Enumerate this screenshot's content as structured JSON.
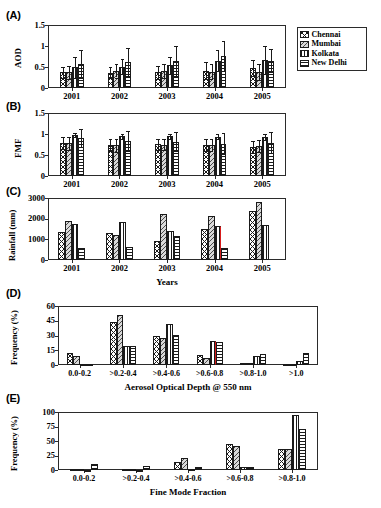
{
  "figure": {
    "legend": {
      "items": [
        {
          "label": "Chennai",
          "pattern": "crosshatch"
        },
        {
          "label": "Mumbai",
          "pattern": "diagonal"
        },
        {
          "label": "Kolkata",
          "pattern": "vertical"
        },
        {
          "label": "New Delhi",
          "pattern": "horizontal"
        }
      ]
    },
    "panels": [
      {
        "tag": "(A)"
      },
      {
        "tag": "(B)"
      },
      {
        "tag": "(C)"
      },
      {
        "tag": "(D)"
      },
      {
        "tag": "(E)"
      }
    ]
  },
  "chart_data": [
    {
      "panel": "A",
      "type": "bar",
      "title": "",
      "xlabel": "",
      "ylabel": "AOD",
      "categories": [
        "2001",
        "2002",
        "2003",
        "2004",
        "2005"
      ],
      "yticks": [
        "0",
        "0.5",
        "1",
        "1.5"
      ],
      "ylim": [
        0,
        1.5
      ],
      "grid": false,
      "errorbars": true,
      "series": [
        {
          "name": "Chennai",
          "values": [
            0.37,
            0.36,
            0.37,
            0.41,
            0.47
          ],
          "errors": [
            0.14,
            0.13,
            0.15,
            0.2,
            0.19
          ]
        },
        {
          "name": "Mumbai",
          "values": [
            0.37,
            0.41,
            0.4,
            0.39,
            0.38
          ],
          "errors": [
            0.15,
            0.16,
            0.16,
            0.18,
            0.19
          ]
        },
        {
          "name": "Kolkata",
          "values": [
            0.5,
            0.51,
            0.54,
            0.65,
            0.67
          ],
          "errors": [
            0.25,
            0.17,
            0.21,
            0.25,
            0.34
          ]
        },
        {
          "name": "New Delhi",
          "values": [
            0.58,
            0.62,
            0.64,
            0.76,
            0.65
          ],
          "errors": [
            0.33,
            0.33,
            0.35,
            0.35,
            0.28
          ]
        }
      ]
    },
    {
      "panel": "B",
      "type": "bar",
      "title": "",
      "xlabel": "",
      "ylabel": "FMF",
      "categories": [
        "2001",
        "2002",
        "2003",
        "2004",
        "2005"
      ],
      "yticks": [
        "0",
        "0.5",
        "1",
        "1.5"
      ],
      "ylim": [
        0,
        1.5
      ],
      "grid": false,
      "errorbars": true,
      "series": [
        {
          "name": "Chennai",
          "values": [
            0.78,
            0.74,
            0.76,
            0.73,
            0.69
          ],
          "errors": [
            0.14,
            0.15,
            0.13,
            0.14,
            0.14
          ]
        },
        {
          "name": "Mumbai",
          "values": [
            0.78,
            0.73,
            0.75,
            0.74,
            0.71
          ],
          "errors": [
            0.15,
            0.15,
            0.14,
            0.15,
            0.15
          ]
        },
        {
          "name": "Kolkata",
          "values": [
            0.97,
            0.95,
            0.95,
            0.94,
            0.93
          ],
          "errors": [
            0.05,
            0.06,
            0.06,
            0.07,
            0.07
          ]
        },
        {
          "name": "New Delhi",
          "values": [
            0.9,
            0.83,
            0.82,
            0.77,
            0.79
          ],
          "errors": [
            0.22,
            0.23,
            0.22,
            0.25,
            0.25
          ]
        }
      ]
    },
    {
      "panel": "C",
      "type": "bar",
      "title": "",
      "xlabel": "Years",
      "ylabel": "Rainfall (mm)",
      "categories": [
        "2001",
        "2002",
        "2003",
        "2004",
        "2005"
      ],
      "yticks": [
        "0",
        "1000",
        "2000",
        "3000"
      ],
      "ylim": [
        0,
        3000
      ],
      "grid": false,
      "errorbars": false,
      "series": [
        {
          "name": "Chennai",
          "values": [
            1350,
            1300,
            900,
            1500,
            2350
          ]
        },
        {
          "name": "Mumbai",
          "values": [
            1900,
            1200,
            2250,
            2130,
            2800
          ]
        },
        {
          "name": "Kolkata",
          "values": [
            1760,
            1830,
            1400,
            1650,
            1700
          ]
        },
        {
          "name": "New Delhi",
          "values": [
            590,
            630,
            1140,
            600,
            0
          ]
        }
      ]
    },
    {
      "panel": "D",
      "type": "bar",
      "title": "",
      "xlabel": "Aerosol Optical Depth @ 550 nm",
      "ylabel": "Frequency (%)",
      "categories": [
        "0.0-0.2",
        ">0.2-0.4",
        ">0.4-0.6",
        ">0.6-0.8",
        ">0.8-1.0",
        ">1.0"
      ],
      "yticks": [
        "0",
        "15",
        "30",
        "45",
        "60"
      ],
      "ylim": [
        0,
        60
      ],
      "grid": false,
      "errorbars": false,
      "series": [
        {
          "name": "Chennai",
          "values": [
            12.0,
            44.0,
            30.0,
            10.0,
            2.5,
            0.7
          ]
        },
        {
          "name": "Mumbai",
          "values": [
            9.5,
            51.0,
            27.0,
            7.5,
            2.3,
            1.5
          ]
        },
        {
          "name": "Kolkata",
          "values": [
            0.8,
            19.0,
            42.0,
            24.0,
            9.0,
            4.5
          ]
        },
        {
          "name": "New Delhi",
          "values": [
            0.6,
            19.5,
            31.0,
            23.0,
            11.5,
            12.0
          ]
        }
      ]
    },
    {
      "panel": "E",
      "type": "bar",
      "title": "",
      "xlabel": "Fine Mode Fraction",
      "ylabel": "Frequency (%)",
      "categories": [
        "0.0-0.2",
        ">0.2-0.4",
        ">0.4-0.6",
        ">0.6-0.8",
        ">0.8-1.0"
      ],
      "yticks": [
        "0",
        "25",
        "50",
        "75",
        "100"
      ],
      "ylim": [
        0,
        100
      ],
      "grid": false,
      "errorbars": false,
      "series": [
        {
          "name": "Chennai",
          "values": [
            1.5,
            2.5,
            13.0,
            44.0,
            37.0
          ]
        },
        {
          "name": "Mumbai",
          "values": [
            1.0,
            1.5,
            21.0,
            41.0,
            36.0
          ]
        },
        {
          "name": "Kolkata",
          "values": [
            0.5,
            0.5,
            1.5,
            4.5,
            94.0
          ]
        },
        {
          "name": "New Delhi",
          "values": [
            10.0,
            7.0,
            5.5,
            5.5,
            71.0
          ]
        }
      ]
    }
  ]
}
